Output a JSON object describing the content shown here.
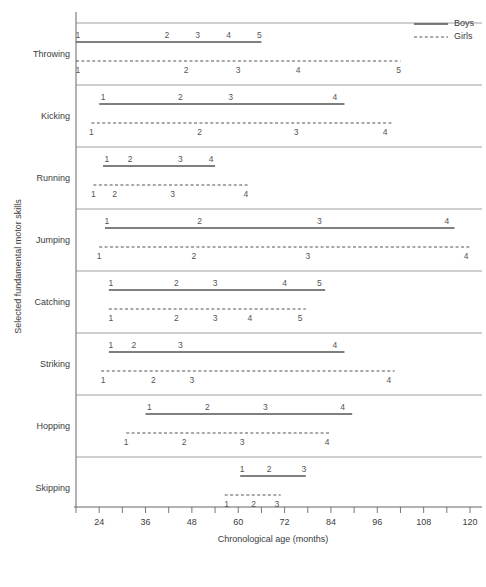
{
  "chart_data": {
    "type": "line",
    "title": "",
    "xlabel": "Chronological age (months)",
    "ylabel": "Selected fundamental motor skills",
    "xlim": [
      18,
      120
    ],
    "xticks": [
      18,
      24,
      30,
      36,
      42,
      48,
      54,
      60,
      66,
      72,
      78,
      84,
      90,
      96,
      102,
      108,
      114,
      120
    ],
    "xtick_labels": [
      {
        "value": 24,
        "label": "24"
      },
      {
        "value": 36,
        "label": "36"
      },
      {
        "value": 48,
        "label": "48"
      },
      {
        "value": 60,
        "label": "60"
      },
      {
        "value": 72,
        "label": "72"
      },
      {
        "value": 84,
        "label": "84"
      },
      {
        "value": 96,
        "label": "96"
      },
      {
        "value": 108,
        "label": "108"
      },
      {
        "value": 120,
        "label": "120"
      }
    ],
    "grid": false,
    "legend_position": "top-right",
    "legend": [
      {
        "name": "Boys",
        "style": "solid"
      },
      {
        "name": "Girls",
        "style": "dashed"
      }
    ],
    "categories": [
      "Throwing",
      "Kicking",
      "Running",
      "Jumping",
      "Catching",
      "Striking",
      "Hopping",
      "Skipping"
    ],
    "series": [
      {
        "name": "Throwing",
        "boys": {
          "start": 18,
          "end": 66,
          "stages": [
            {
              "label": "1",
              "value": 18.5
            },
            {
              "label": "2",
              "value": 41.5
            },
            {
              "label": "3",
              "value": 49.5
            },
            {
              "label": "4",
              "value": 57.5
            },
            {
              "label": "5",
              "value": 65.5
            }
          ]
        },
        "girls": {
          "start": 18,
          "end": 102,
          "stages": [
            {
              "label": "1",
              "value": 18.5
            },
            {
              "label": "2",
              "value": 46.5
            },
            {
              "label": "3",
              "value": 60
            },
            {
              "label": "4",
              "value": 75.5
            },
            {
              "label": "5",
              "value": 101.5
            }
          ]
        }
      },
      {
        "name": "Kicking",
        "boys": {
          "start": 24,
          "end": 87.5,
          "stages": [
            {
              "label": "1",
              "value": 25
            },
            {
              "label": "2",
              "value": 45
            },
            {
              "label": "3",
              "value": 58
            },
            {
              "label": "4",
              "value": 85
            }
          ]
        },
        "girls": {
          "start": 22,
          "end": 100,
          "stages": [
            {
              "label": "1",
              "value": 22
            },
            {
              "label": "2",
              "value": 50
            },
            {
              "label": "3",
              "value": 75
            },
            {
              "label": "4",
              "value": 98
            }
          ]
        }
      },
      {
        "name": "Running",
        "boys": {
          "start": 25,
          "end": 54,
          "stages": [
            {
              "label": "1",
              "value": 26
            },
            {
              "label": "2",
              "value": 32
            },
            {
              "label": "3",
              "value": 45
            },
            {
              "label": "4",
              "value": 53
            }
          ]
        },
        "girls": {
          "start": 22.5,
          "end": 63,
          "stages": [
            {
              "label": "1",
              "value": 22.5
            },
            {
              "label": "2",
              "value": 28
            },
            {
              "label": "3",
              "value": 43
            },
            {
              "label": "4",
              "value": 62
            }
          ]
        }
      },
      {
        "name": "Jumping",
        "boys": {
          "start": 25.5,
          "end": 116,
          "stages": [
            {
              "label": "1",
              "value": 26
            },
            {
              "label": "2",
              "value": 50
            },
            {
              "label": "3",
              "value": 81
            },
            {
              "label": "4",
              "value": 114
            }
          ]
        },
        "girls": {
          "start": 24,
          "end": 120,
          "stages": [
            {
              "label": "1",
              "value": 24
            },
            {
              "label": "2",
              "value": 48.5
            },
            {
              "label": "3",
              "value": 78
            },
            {
              "label": "4",
              "value": 119
            }
          ]
        }
      },
      {
        "name": "Catching",
        "boys": {
          "start": 26.5,
          "end": 82.5,
          "stages": [
            {
              "label": "1",
              "value": 27
            },
            {
              "label": "2",
              "value": 44
            },
            {
              "label": "3",
              "value": 54
            },
            {
              "label": "4",
              "value": 72
            },
            {
              "label": "5",
              "value": 81
            }
          ]
        },
        "girls": {
          "start": 26.5,
          "end": 77.5,
          "stages": [
            {
              "label": "1",
              "value": 27
            },
            {
              "label": "2",
              "value": 44
            },
            {
              "label": "3",
              "value": 54
            },
            {
              "label": "4",
              "value": 63
            },
            {
              "label": "5",
              "value": 76
            }
          ]
        }
      },
      {
        "name": "Striking",
        "boys": {
          "start": 26.5,
          "end": 87.5,
          "stages": [
            {
              "label": "1",
              "value": 27
            },
            {
              "label": "2",
              "value": 33
            },
            {
              "label": "3",
              "value": 45
            },
            {
              "label": "4",
              "value": 85
            }
          ]
        },
        "girls": {
          "start": 24.5,
          "end": 100.5,
          "stages": [
            {
              "label": "1",
              "value": 25
            },
            {
              "label": "2",
              "value": 38
            },
            {
              "label": "3",
              "value": 48
            },
            {
              "label": "4",
              "value": 99
            }
          ]
        }
      },
      {
        "name": "Hopping",
        "boys": {
          "start": 36,
          "end": 89.5,
          "stages": [
            {
              "label": "1",
              "value": 37
            },
            {
              "label": "2",
              "value": 52
            },
            {
              "label": "3",
              "value": 67
            },
            {
              "label": "4",
              "value": 87
            }
          ]
        },
        "girls": {
          "start": 31,
          "end": 84,
          "stages": [
            {
              "label": "1",
              "value": 31
            },
            {
              "label": "2",
              "value": 46
            },
            {
              "label": "3",
              "value": 61
            },
            {
              "label": "4",
              "value": 83
            }
          ]
        }
      },
      {
        "name": "Skipping",
        "boys": {
          "start": 60.5,
          "end": 77.5,
          "stages": [
            {
              "label": "1",
              "value": 61
            },
            {
              "label": "2",
              "value": 68
            },
            {
              "label": "3",
              "value": 77
            }
          ]
        },
        "girls": {
          "start": 56.5,
          "end": 71,
          "stages": [
            {
              "label": "1",
              "value": 57
            },
            {
              "label": "2",
              "value": 64
            },
            {
              "label": "3",
              "value": 70
            }
          ]
        }
      }
    ]
  },
  "axis": {
    "x_title": "Chronological age (months)",
    "y_title": "Selected fundamental motor skills"
  },
  "legend": {
    "boys_label": "Boys",
    "girls_label": "Girls"
  },
  "colors": {
    "line": "#555555",
    "axis": "#666666",
    "text": "#3c3c3c"
  }
}
